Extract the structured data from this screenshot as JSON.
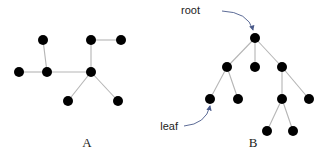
{
  "diagram": {
    "tree_a": {
      "caption": "A",
      "nodes": [
        {
          "id": "a1",
          "x": 43,
          "y": 40
        },
        {
          "id": "a2",
          "x": 91,
          "y": 40
        },
        {
          "id": "a3",
          "x": 121,
          "y": 40
        },
        {
          "id": "a4",
          "x": 19,
          "y": 72
        },
        {
          "id": "a5",
          "x": 47,
          "y": 72
        },
        {
          "id": "a6",
          "x": 91,
          "y": 72
        },
        {
          "id": "a7",
          "x": 68,
          "y": 101
        },
        {
          "id": "a8",
          "x": 118,
          "y": 101
        }
      ],
      "edges": [
        [
          "a1",
          "a5"
        ],
        [
          "a4",
          "a5"
        ],
        [
          "a5",
          "a6"
        ],
        [
          "a6",
          "a2"
        ],
        [
          "a2",
          "a3"
        ],
        [
          "a6",
          "a7"
        ],
        [
          "a6",
          "a8"
        ]
      ]
    },
    "tree_b": {
      "caption": "B",
      "root_label": "root",
      "leaf_label": "leaf",
      "nodes": [
        {
          "id": "b0",
          "x": 255,
          "y": 38
        },
        {
          "id": "b1",
          "x": 227,
          "y": 67
        },
        {
          "id": "b2",
          "x": 255,
          "y": 67
        },
        {
          "id": "b3",
          "x": 282,
          "y": 67
        },
        {
          "id": "b4",
          "x": 210,
          "y": 99
        },
        {
          "id": "b5",
          "x": 238,
          "y": 99
        },
        {
          "id": "b6",
          "x": 282,
          "y": 99
        },
        {
          "id": "b7",
          "x": 309,
          "y": 99
        },
        {
          "id": "b8",
          "x": 267,
          "y": 131
        },
        {
          "id": "b9",
          "x": 293,
          "y": 131
        }
      ],
      "edges": [
        [
          "b0",
          "b1"
        ],
        [
          "b0",
          "b2"
        ],
        [
          "b0",
          "b3"
        ],
        [
          "b1",
          "b4"
        ],
        [
          "b1",
          "b5"
        ],
        [
          "b3",
          "b6"
        ],
        [
          "b3",
          "b7"
        ],
        [
          "b6",
          "b8"
        ],
        [
          "b6",
          "b9"
        ]
      ]
    }
  }
}
